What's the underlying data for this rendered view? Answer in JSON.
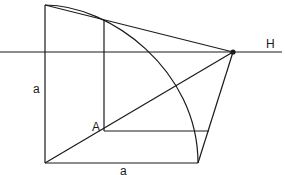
{
  "diagram": {
    "labels": {
      "horizon": "H",
      "point_a": "A",
      "side_vertical": "a",
      "side_horizontal": "a"
    },
    "colors": {
      "stroke": "#1a1a1a",
      "background": "#ffffff"
    }
  }
}
